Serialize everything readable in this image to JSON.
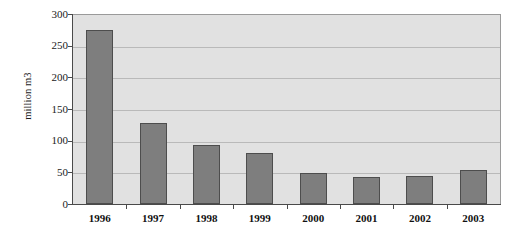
{
  "chart_data": {
    "type": "bar",
    "title": "",
    "subtitle": "",
    "xlabel": "",
    "ylabel": "million m3",
    "categories": [
      "1996",
      "1997",
      "1998",
      "1999",
      "2000",
      "2001",
      "2002",
      "2003"
    ],
    "values": [
      275,
      128,
      93,
      80,
      49,
      42,
      45,
      53
    ],
    "series": [
      {
        "name": "",
        "values": [
          275,
          128,
          93,
          80,
          49,
          42,
          45,
          53
        ]
      }
    ],
    "ylim": [
      0,
      300
    ],
    "ytick_labels": [
      "0",
      "50",
      "100",
      "150",
      "200",
      "250",
      "300"
    ],
    "ytick_values": [
      0,
      50,
      100,
      150,
      200,
      250,
      300
    ],
    "grid": true,
    "grid_axis": "y",
    "legend": false,
    "legend_position": "none",
    "bar_color": "#7e7e7e",
    "bar_border_color": "#4d4d4d",
    "plot_background_color": "#e1e1e1",
    "gridline_color": "#b9b9b9",
    "axis_color": "#4a4a4a",
    "figure_background_color": "#ffffff"
  }
}
